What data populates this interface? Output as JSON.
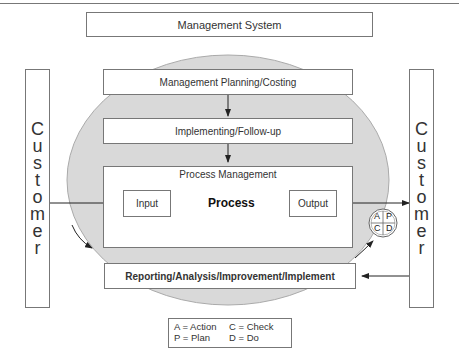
{
  "diagram": {
    "title": "Management System",
    "planning": "Management Planning/Costing",
    "implementing": "Implementing/Follow-up",
    "process_management": {
      "label": "Process Management",
      "input": "Input",
      "process": "Process",
      "output": "Output"
    },
    "reporting": "Reporting/Analysis/Improvement/Implement",
    "customer_left": [
      "C",
      "u",
      "s",
      "t",
      "o",
      "m",
      "e",
      "r"
    ],
    "customer_right": [
      "C",
      "u",
      "s",
      "t",
      "o",
      "m",
      "e",
      "r"
    ],
    "pdca": {
      "a": "A",
      "p": "P",
      "c": "C",
      "d": "D"
    },
    "legend": {
      "a": "A = Action",
      "c": "C = Check",
      "p": "P = Plan",
      "d": "D = Do"
    },
    "colors": {
      "ellipse_fill": "#d9d9d9",
      "border": "#777777",
      "process_fill": "#c8c8c8"
    }
  }
}
